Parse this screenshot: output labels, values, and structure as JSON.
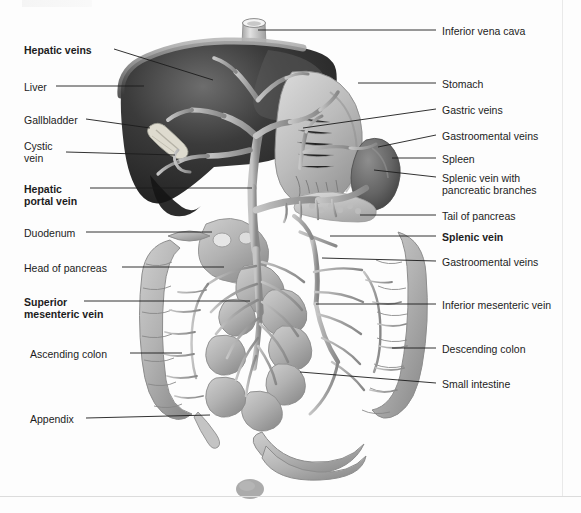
{
  "figure": {
    "caption_partial": "",
    "background_color": "#fdfdfd",
    "line_color": "#1c1c1c"
  },
  "labels_left": [
    {
      "id": "hepatic-veins",
      "text": "Hepatic veins",
      "bold": true,
      "x": 24,
      "y": 44,
      "lines": [
        "Hepatic veins"
      ]
    },
    {
      "id": "liver",
      "text": "Liver",
      "bold": false,
      "x": 24,
      "y": 81,
      "lines": [
        "Liver"
      ]
    },
    {
      "id": "gallbladder",
      "text": "Gallbladder",
      "bold": false,
      "x": 24,
      "y": 114,
      "lines": [
        "Gallbladder"
      ]
    },
    {
      "id": "cystic-vein",
      "text": "Cystic vein",
      "bold": false,
      "x": 24,
      "y": 140,
      "lines": [
        "Cystic",
        "vein"
      ]
    },
    {
      "id": "hepatic-portal-vein",
      "text": "Hepatic portal vein",
      "bold": true,
      "x": 24,
      "y": 183,
      "lines": [
        "Hepatic",
        "portal vein"
      ]
    },
    {
      "id": "duodenum",
      "text": "Duodenum",
      "bold": false,
      "x": 24,
      "y": 227,
      "lines": [
        "Duodenum"
      ]
    },
    {
      "id": "head-of-pancreas",
      "text": "Head of pancreas",
      "bold": false,
      "x": 24,
      "y": 262,
      "lines": [
        "Head of pancreas"
      ]
    },
    {
      "id": "superior-mesenteric-vein",
      "text": "Superior mesenteric vein",
      "bold": true,
      "x": 24,
      "y": 296,
      "lines": [
        "Superior",
        "mesenteric vein"
      ]
    },
    {
      "id": "ascending-colon",
      "text": "Ascending colon",
      "bold": false,
      "x": 30,
      "y": 348,
      "lines": [
        "Ascending colon"
      ]
    },
    {
      "id": "appendix",
      "text": "Appendix",
      "bold": false,
      "x": 30,
      "y": 413,
      "lines": [
        "Appendix"
      ]
    }
  ],
  "labels_right": [
    {
      "id": "inferior-vena-cava",
      "text": "Inferior vena cava",
      "bold": false,
      "x": 442,
      "y": 25,
      "lines": [
        "Inferior vena cava"
      ]
    },
    {
      "id": "stomach",
      "text": "Stomach",
      "bold": false,
      "x": 442,
      "y": 78,
      "lines": [
        "Stomach"
      ]
    },
    {
      "id": "gastric-veins",
      "text": "Gastric veins",
      "bold": false,
      "x": 442,
      "y": 104,
      "lines": [
        "Gastric veins"
      ]
    },
    {
      "id": "gastroomental-veins-upper",
      "text": "Gastroomental veins",
      "bold": false,
      "x": 442,
      "y": 130,
      "lines": [
        "Gastroomental veins"
      ]
    },
    {
      "id": "spleen",
      "text": "Spleen",
      "bold": false,
      "x": 442,
      "y": 153,
      "lines": [
        "Spleen"
      ]
    },
    {
      "id": "splenic-vein-with-pancreatic-branches",
      "text": "Splenic vein with pancreatic branches",
      "bold": false,
      "x": 442,
      "y": 172,
      "lines": [
        "Splenic vein with",
        "pancreatic branches"
      ]
    },
    {
      "id": "tail-of-pancreas",
      "text": "Tail of pancreas",
      "bold": false,
      "x": 442,
      "y": 210,
      "lines": [
        "Tail of pancreas"
      ]
    },
    {
      "id": "splenic-vein",
      "text": "Splenic vein",
      "bold": true,
      "x": 442,
      "y": 231,
      "lines": [
        "Splenic vein"
      ]
    },
    {
      "id": "gastroomental-veins-lower",
      "text": "Gastroomental veins",
      "bold": false,
      "x": 442,
      "y": 256,
      "lines": [
        "Gastroomental veins"
      ]
    },
    {
      "id": "inferior-mesenteric-vein",
      "text": "Inferior mesenteric vein",
      "bold": false,
      "x": 442,
      "y": 299,
      "lines": [
        "Inferior mesenteric vein"
      ]
    },
    {
      "id": "descending-colon",
      "text": "Descending colon",
      "bold": false,
      "x": 442,
      "y": 343,
      "lines": [
        "Descending colon"
      ]
    },
    {
      "id": "small-intestine",
      "text": "Small intestine",
      "bold": false,
      "x": 442,
      "y": 378,
      "lines": [
        "Small intestine"
      ]
    }
  ],
  "leader_lines_left": [
    {
      "id": "leader-hepatic-veins",
      "x1": 114,
      "y1": 49,
      "x2": 213,
      "y2": 80
    },
    {
      "id": "leader-liver",
      "x1": 56,
      "y1": 86,
      "x2": 144,
      "y2": 86
    },
    {
      "id": "leader-gallbladder",
      "x1": 86,
      "y1": 119,
      "x2": 150,
      "y2": 128
    },
    {
      "id": "leader-cystic-vein",
      "x1": 66,
      "y1": 152,
      "x2": 175,
      "y2": 155
    },
    {
      "id": "leader-hepatic-portal-vein",
      "x1": 90,
      "y1": 188,
      "x2": 252,
      "y2": 188
    },
    {
      "id": "leader-duodenum",
      "x1": 86,
      "y1": 232,
      "x2": 212,
      "y2": 232
    },
    {
      "id": "leader-head-of-pancreas",
      "x1": 122,
      "y1": 267,
      "x2": 224,
      "y2": 267
    },
    {
      "id": "leader-superior-mesenteric-vein",
      "x1": 84,
      "y1": 301,
      "x2": 250,
      "y2": 301
    },
    {
      "id": "leader-ascending-colon",
      "x1": 130,
      "y1": 353,
      "x2": 182,
      "y2": 353
    },
    {
      "id": "leader-appendix",
      "x1": 86,
      "y1": 418,
      "x2": 210,
      "y2": 415
    }
  ],
  "leader_lines_right": [
    {
      "id": "leader-inferior-vena-cava",
      "x1": 436,
      "y1": 30,
      "x2": 258,
      "y2": 30
    },
    {
      "id": "leader-stomach",
      "x1": 436,
      "y1": 83,
      "x2": 358,
      "y2": 83
    },
    {
      "id": "leader-gastric-veins",
      "x1": 436,
      "y1": 109,
      "x2": 303,
      "y2": 128
    },
    {
      "id": "leader-gastroomental-upper",
      "x1": 436,
      "y1": 135,
      "x2": 378,
      "y2": 147
    },
    {
      "id": "leader-spleen",
      "x1": 436,
      "y1": 158,
      "x2": 392,
      "y2": 158
    },
    {
      "id": "leader-splenic-vein-pancreatic",
      "x1": 436,
      "y1": 177,
      "x2": 374,
      "y2": 170
    },
    {
      "id": "leader-tail-of-pancreas",
      "x1": 436,
      "y1": 215,
      "x2": 360,
      "y2": 215
    },
    {
      "id": "leader-splenic-vein",
      "x1": 436,
      "y1": 236,
      "x2": 330,
      "y2": 236
    },
    {
      "id": "leader-gastroomental-lower",
      "x1": 436,
      "y1": 261,
      "x2": 322,
      "y2": 258
    },
    {
      "id": "leader-inferior-mesenteric-vein",
      "x1": 436,
      "y1": 304,
      "x2": 316,
      "y2": 304
    },
    {
      "id": "leader-descending-colon",
      "x1": 436,
      "y1": 348,
      "x2": 392,
      "y2": 348
    },
    {
      "id": "leader-small-intestine",
      "x1": 436,
      "y1": 383,
      "x2": 300,
      "y2": 372
    }
  ],
  "palette": {
    "liver_dark": "#2b2b2b",
    "liver_mid": "#4a4a4a",
    "liver_rim": "#8d8d8d",
    "stomach": "#b9b9b9",
    "stomach_shade": "#9a9a9a",
    "spleen": "#6f6f6f",
    "intestine": "#b5b5b5",
    "intestine_shade": "#949494",
    "vessel": "#a6a6a6",
    "vessel_light": "#c9c9c9",
    "pancreas": "#cacaca",
    "outline": "#6e6e6e"
  }
}
